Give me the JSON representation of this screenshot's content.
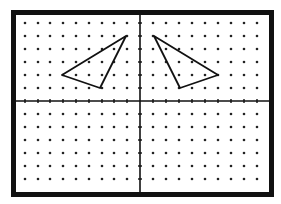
{
  "diagram": {
    "title": "",
    "frame": {
      "x": 11,
      "y": 10,
      "width": 263,
      "height": 187,
      "stroke": 5,
      "color": "#111111"
    },
    "grid": {
      "dot_color": "#222222",
      "dot_radius": 1.3,
      "x_positions": [
        25,
        38,
        50,
        63,
        76,
        89,
        102,
        114,
        127,
        153,
        166,
        179,
        192,
        205,
        218,
        231,
        244,
        257
      ],
      "y_positions": [
        23,
        36,
        49,
        62,
        75,
        88,
        114,
        127,
        140,
        153,
        166,
        179
      ]
    },
    "axes": {
      "color": "#111111",
      "x_axis_y": 101,
      "y_axis_x": 140,
      "tick_length": 2
    },
    "shapes": [
      {
        "name": "left-triangle",
        "points": [
          [
            126,
            36
          ],
          [
            62,
            75
          ],
          [
            100,
            88
          ]
        ]
      },
      {
        "name": "right-triangle",
        "points": [
          [
            154,
            36
          ],
          [
            218,
            75
          ],
          [
            180,
            88
          ]
        ]
      }
    ],
    "line_color": "#111111"
  }
}
